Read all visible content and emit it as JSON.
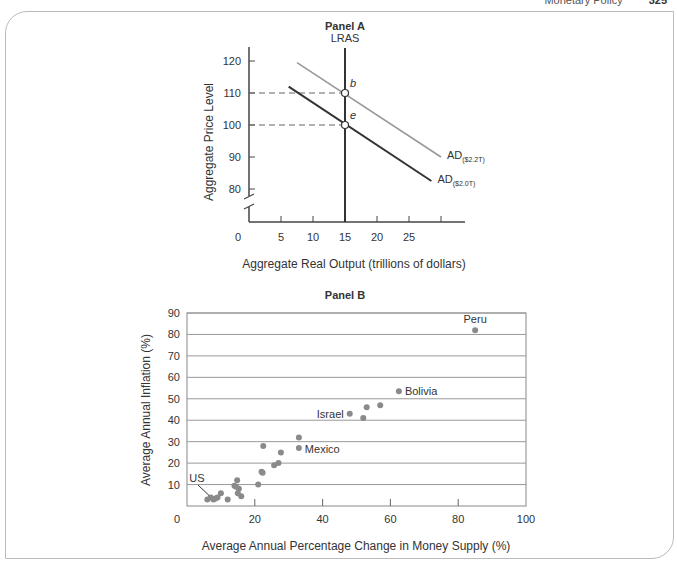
{
  "header": {
    "section": "Monetary Policy",
    "page": "325"
  },
  "chart_data": [
    {
      "type": "line",
      "title": "Panel A",
      "xlabel": "Aggregate Real Output (trillions of dollars)",
      "ylabel": "Aggregate Price Level",
      "xticks": [
        "0",
        "5",
        "10",
        "15",
        "20",
        "25"
      ],
      "yticks": [
        "80",
        "90",
        "100",
        "110",
        "120"
      ],
      "xlim": [
        0,
        34
      ],
      "ylim": [
        75,
        125
      ],
      "axis_break": true,
      "grid": false,
      "series": [
        {
          "name": "LRAS",
          "type": "vertical",
          "x": 15
        },
        {
          "name": "AD($2.0T)",
          "label_main": "AD",
          "label_sub": "($2.0T)",
          "points": [
            [
              6.2,
              112
            ],
            [
              28.5,
              82.5
            ]
          ],
          "color": "#333333"
        },
        {
          "name": "AD($2.2T)",
          "label_main": "AD",
          "label_sub": "($2.2T)",
          "points": [
            [
              7.5,
              119.5
            ],
            [
              30,
              90
            ]
          ],
          "color": "#999999"
        }
      ],
      "annotations": [
        {
          "label": "b",
          "x": 15,
          "y": 110
        },
        {
          "label": "e",
          "x": 15,
          "y": 100
        }
      ]
    },
    {
      "type": "scatter",
      "title": "Panel B",
      "xlabel": "Average Annual Percentage Change in Money Supply (%)",
      "ylabel": "Average Annual Inflation (%)",
      "xticks": [
        "0",
        "20",
        "40",
        "60",
        "80",
        "100"
      ],
      "yticks": [
        "10",
        "20",
        "30",
        "40",
        "50",
        "60",
        "70",
        "80",
        "90"
      ],
      "ytick_zero": "0",
      "xlim": [
        0,
        100
      ],
      "ylim": [
        0,
        90
      ],
      "grid": true,
      "points": [
        {
          "x": 6,
          "y": 3
        },
        {
          "x": 7,
          "y": 4
        },
        {
          "x": 7.8,
          "y": 3
        },
        {
          "x": 8.4,
          "y": 3.5
        },
        {
          "x": 9,
          "y": 4
        },
        {
          "x": 10,
          "y": 6
        },
        {
          "x": 12,
          "y": 3
        },
        {
          "x": 14,
          "y": 9.5
        },
        {
          "x": 14.5,
          "y": 9
        },
        {
          "x": 14.8,
          "y": 12
        },
        {
          "x": 15,
          "y": 6
        },
        {
          "x": 15.3,
          "y": 8
        },
        {
          "x": 16,
          "y": 4.5
        },
        {
          "x": 21,
          "y": 10
        },
        {
          "x": 22,
          "y": 16
        },
        {
          "x": 22.3,
          "y": 15.5
        },
        {
          "x": 22.5,
          "y": 28
        },
        {
          "x": 25.7,
          "y": 19
        },
        {
          "x": 27,
          "y": 20
        },
        {
          "x": 27.7,
          "y": 25
        },
        {
          "x": 33,
          "y": 32
        },
        {
          "x": 33,
          "y": 27,
          "label": "Mexico"
        },
        {
          "x": 48,
          "y": 43,
          "label": "Israel"
        },
        {
          "x": 52,
          "y": 41
        },
        {
          "x": 53,
          "y": 46
        },
        {
          "x": 57,
          "y": 47
        },
        {
          "x": 62.5,
          "y": 53.5,
          "label": "Bolivia"
        },
        {
          "x": 85,
          "y": 82,
          "label": "Peru"
        }
      ],
      "callouts": [
        {
          "label": "US",
          "x": 6.5,
          "y": 4
        }
      ]
    }
  ]
}
